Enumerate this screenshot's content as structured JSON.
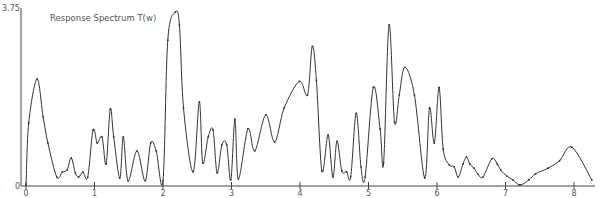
{
  "chart_data": {
    "type": "line",
    "title": "Response Spectrum T(w)",
    "xlabel": "",
    "ylabel": "",
    "xlim": [
      0,
      8.3
    ],
    "ylim": [
      0,
      3.75
    ],
    "grid": false,
    "legend": null,
    "x_ticks": [
      0,
      1,
      2,
      3,
      4,
      5,
      6,
      7,
      8
    ],
    "x_tick_labels": [
      "0",
      "1",
      "2",
      "3",
      "4",
      "5",
      "6",
      "7",
      "8"
    ],
    "y_tick_labels": [
      "0",
      "3.75"
    ],
    "series": [
      {
        "name": "T(w)",
        "x": [
          0.0,
          0.04,
          0.16,
          0.25,
          0.32,
          0.45,
          0.53,
          0.6,
          0.66,
          0.72,
          0.77,
          0.83,
          0.9,
          0.98,
          1.04,
          1.11,
          1.17,
          1.23,
          1.28,
          1.37,
          1.42,
          1.49,
          1.62,
          1.74,
          1.82,
          1.9,
          2.0,
          2.07,
          2.18,
          2.24,
          2.3,
          2.44,
          2.53,
          2.58,
          2.66,
          2.73,
          2.79,
          2.86,
          2.93,
          2.99,
          3.05,
          3.1,
          3.24,
          3.34,
          3.5,
          3.63,
          3.77,
          3.99,
          4.11,
          4.18,
          4.24,
          4.32,
          4.41,
          4.48,
          4.54,
          4.61,
          4.68,
          4.74,
          4.82,
          4.89,
          4.95,
          5.07,
          5.17,
          5.22,
          5.3,
          5.38,
          5.45,
          5.53,
          5.67,
          5.82,
          5.89,
          5.96,
          6.03,
          6.09,
          6.18,
          6.25,
          6.31,
          6.38,
          6.43,
          6.48,
          6.54,
          6.6,
          6.67,
          6.8,
          6.88,
          6.93,
          7.02,
          7.11,
          7.21,
          7.34,
          7.44,
          7.62,
          7.79,
          7.97,
          8.26
        ],
        "values": [
          0.0,
          1.33,
          2.27,
          1.46,
          0.9,
          0.17,
          0.28,
          0.32,
          0.58,
          0.26,
          0.17,
          0.28,
          0.17,
          1.18,
          0.9,
          1.03,
          0.45,
          1.63,
          1.03,
          0.15,
          1.03,
          0.09,
          0.73,
          0.09,
          0.9,
          0.73,
          0.09,
          3.1,
          3.7,
          3.43,
          1.65,
          0.28,
          1.78,
          0.47,
          1.03,
          1.18,
          0.26,
          0.86,
          0.86,
          0.11,
          1.41,
          0.13,
          1.2,
          0.73,
          1.5,
          0.92,
          1.65,
          2.22,
          1.93,
          2.97,
          2.24,
          0.3,
          1.07,
          0.17,
          0.94,
          0.3,
          0.28,
          0.17,
          1.54,
          0.39,
          0.17,
          2.09,
          1.2,
          0.47,
          3.43,
          1.35,
          1.93,
          2.52,
          1.93,
          0.15,
          1.65,
          0.9,
          2.09,
          0.77,
          0.43,
          0.39,
          0.17,
          0.45,
          0.6,
          0.45,
          0.36,
          0.23,
          0.17,
          0.56,
          0.45,
          0.32,
          0.19,
          0.11,
          0.0,
          0.11,
          0.24,
          0.36,
          0.52,
          0.81,
          0.11
        ]
      }
    ],
    "annotations": [
      "Response Spectrum T(w)",
      "3.75",
      "0"
    ]
  },
  "axes": {
    "y_top_label": "3.75",
    "y_origin_label": "0",
    "x_labels": [
      "0",
      "1",
      "2",
      "3",
      "4",
      "5",
      "6",
      "7",
      "8"
    ]
  },
  "title": "Response Spectrum T(w)",
  "colors": {
    "line": "#333333",
    "axis": "#444444",
    "text": "#555555",
    "background": "#ffffff"
  },
  "layout_px": {
    "origin_x": 26,
    "origin_y": 185,
    "px_per_x": 68.5,
    "px_per_y": 46.7,
    "yaxis_x": 21
  }
}
